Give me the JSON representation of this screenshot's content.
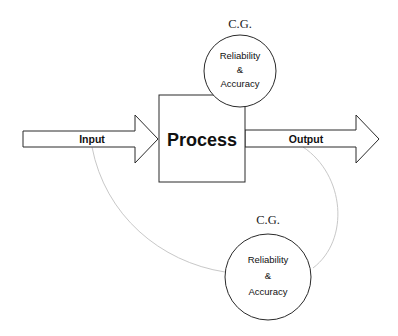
{
  "diagram": {
    "colors": {
      "stroke": "#2a2a2a",
      "connector": "#c8c8c8",
      "text": "#111111",
      "background": "#ffffff"
    },
    "input_arrow": {
      "label": "Input"
    },
    "process_box": {
      "label": "Process"
    },
    "output_arrow": {
      "label": "Output"
    },
    "top_control": {
      "tag": "C.G.",
      "lines": [
        "Reliability",
        "&",
        "Accuracy"
      ]
    },
    "bottom_control": {
      "tag": "C.G.",
      "lines": [
        "Reliability",
        "&",
        "Accuracy"
      ]
    }
  }
}
